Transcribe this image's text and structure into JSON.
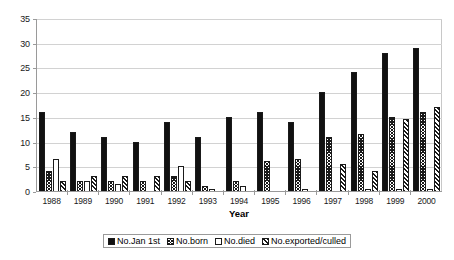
{
  "chart_data": {
    "type": "bar",
    "title": "",
    "subtitle": "",
    "xlabel": "Year",
    "ylabel": "",
    "ylim": [
      0,
      35
    ],
    "ytick_step": 5,
    "yticks": [
      0,
      5,
      10,
      15,
      20,
      25,
      30,
      35
    ],
    "grid": true,
    "grid_axis": "y",
    "legend_position": "bottom-center",
    "categories": [
      "1988",
      "1989",
      "1990",
      "1991",
      "1992",
      "1993",
      "1994",
      "1995",
      "1996",
      "1997",
      "1998",
      "1999",
      "2000"
    ],
    "series": [
      {
        "name": "No.Jan 1st",
        "fill": "solid-black",
        "values": [
          16,
          12,
          11,
          10,
          14,
          11,
          15,
          16,
          14,
          20,
          24,
          28,
          29
        ]
      },
      {
        "name": "No.born",
        "fill": "dense-cross-hatch",
        "values": [
          4,
          2,
          2,
          2,
          3,
          1,
          2,
          6,
          6.5,
          11,
          11.5,
          15,
          16
        ]
      },
      {
        "name": "No.died",
        "fill": "white-empty",
        "values": [
          6.5,
          2,
          1.5,
          0,
          5,
          0.5,
          1,
          0,
          0.5,
          0,
          0.5,
          0.5,
          0.5
        ]
      },
      {
        "name": "No.exported/culled",
        "fill": "diagonal-hatch",
        "values": [
          2,
          3,
          3,
          3,
          2,
          0,
          0,
          0,
          0,
          5.5,
          4,
          14.5,
          17
        ]
      }
    ]
  },
  "colors": {
    "plot_background": "#ffffff",
    "page_background": "#ffffff",
    "gridline": "#d2d2d2",
    "axis_line": "#9a9a9a",
    "bar_outline": "#1a1a1a",
    "series_solid": "#111111",
    "text": "#1a1a1a"
  }
}
